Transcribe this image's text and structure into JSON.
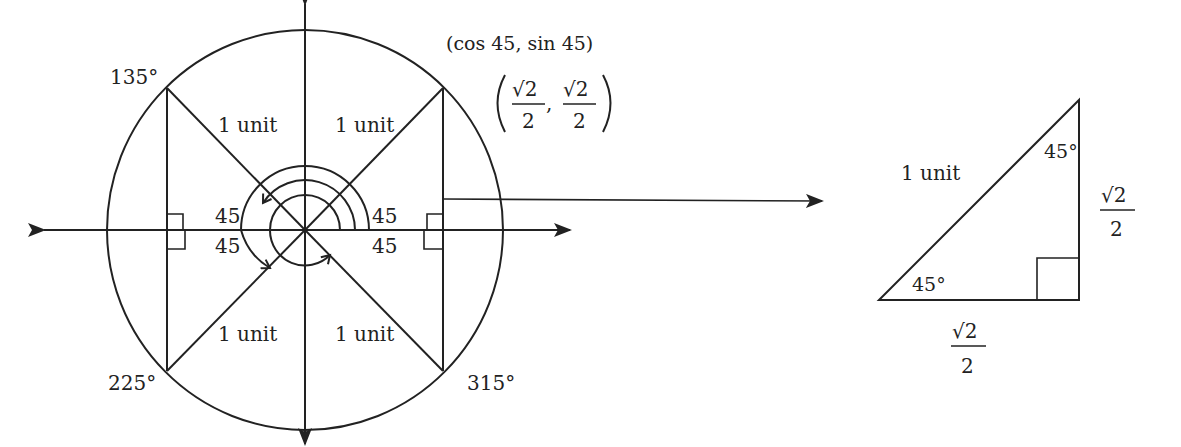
{
  "diagram": {
    "colors": {
      "ink": "#222222",
      "background": "#ffffff"
    },
    "unit_circle": {
      "angle_labels": {
        "q2": "135°",
        "q3": "225°",
        "q4": "315°"
      },
      "radius_labels": {
        "q1": "1 unit",
        "q2": "1 unit",
        "q3": "1 unit",
        "q4": "1 unit"
      },
      "reference_angles": {
        "q1_top": "45",
        "q1_bottom": "45",
        "q2_top": "45",
        "q3_bottom": "45"
      },
      "point_label": "(cos 45, sin 45)",
      "point_coords": {
        "x_num": "√2",
        "x_den": "2",
        "comma": ",",
        "y_num": "√2",
        "y_den": "2"
      }
    },
    "triangle": {
      "hypotenuse_label": "1 unit",
      "top_angle": "45°",
      "bottom_angle": "45°",
      "vertical_leg": {
        "num": "√2",
        "den": "2"
      },
      "horizontal_leg": {
        "num": "√2",
        "den": "2"
      }
    }
  }
}
